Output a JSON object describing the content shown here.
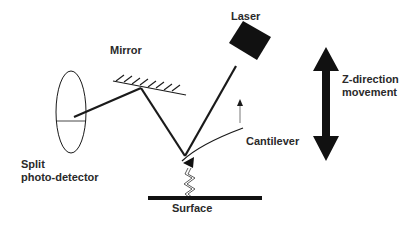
{
  "diagram": {
    "labels": {
      "mirror": "Mirror",
      "laser": "Laser",
      "z_direction_line1": "Z-direction",
      "z_direction_line2": "movement",
      "cantilever": "Cantilever",
      "split_line1": "Split",
      "split_line2": "photo-detector",
      "surface": "Surface"
    },
    "colors": {
      "stroke": "#1a1a1a",
      "text": "#2a2a2a",
      "background": "#ffffff"
    }
  }
}
